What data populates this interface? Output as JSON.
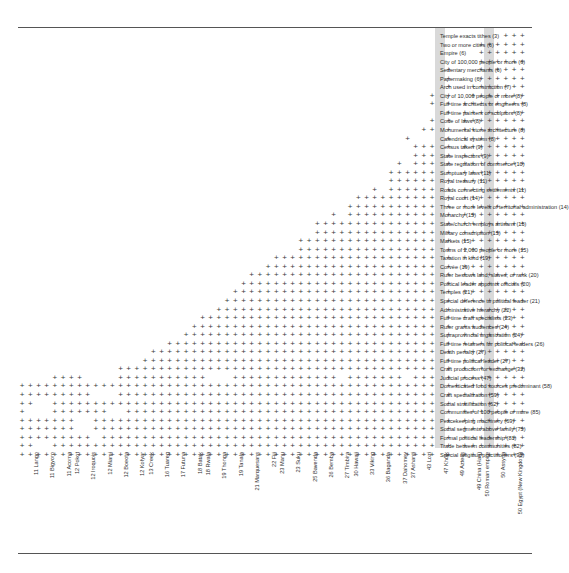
{
  "figure": {
    "type": "guttman-scalogram",
    "mark_glyph": "+",
    "band_color": "#d9d9d9",
    "rule_color": "#555555",
    "mark_color": "#3a3a3a"
  },
  "chart_data": {
    "type": "heatmap",
    "title": "",
    "subtitle": "",
    "xlabel": "",
    "ylabel": "",
    "grid": false,
    "legend": "none",
    "x": [
      "11 Lango",
      "11 Bigyoro",
      "11 Acoma",
      "12 Pokot",
      "12 Iroquois",
      "12 Miami",
      "12 Boeota",
      "12 Kofyar",
      "13 Creek",
      "16 Tuareg",
      "17 Futuna",
      "18 Batak",
      "18 Rwala",
      "19 Thonga",
      "19 Tanala",
      "21 Marquesans",
      "22 Fiji",
      "23 Manu",
      "23 Suku",
      "25 Bavenda",
      "26 Bemba",
      "27 Timbira",
      "30 Hawaii",
      "33 Viking",
      "36 Baganda",
      "37 Dahomey",
      "37 Ashanti",
      "43 Lozi",
      "47 Khoik",
      "49 Aztecs",
      "49 China (Han)",
      "50 Roman empire",
      "50 Assyria",
      "50 Egypt (New Kingdom)"
    ],
    "x_highlighted": [
      "30 Hawaii",
      "47 Khoik"
    ],
    "y": [
      "Temple exacts tithes (3)",
      "Two or more cities  (6)",
      "Empire (6)",
      "City of 100,000 people or more (6)",
      "Sedentary merchants (6)",
      "Papermaking (6)",
      "Arch used in construction (7)",
      "City of 10,000 people or more (8)",
      "Full-time architects or engineers (8)",
      "Full-time painters or sculptors (8)",
      "Code of laws (8)",
      "Monumental stone architecture (8)",
      "Calendrical system (8)",
      "Census taken (9)",
      "State inspectors (9)",
      "State regulation of commerce (10)",
      "Sumptuary laws (11)",
      "Royal treasury (11)",
      "Roads connecting settlements (11)",
      "Royal court  (14)",
      "Three or more levels of territorial administration  (14)",
      "Monarchy (15)",
      "State/church employs artisans (15)",
      "Military conscription (15)",
      "Markets (15)",
      "Towns of 2,000 people or more (15)",
      "Taxation in kind (19)",
      "Corvée (19)",
      "Ruler bestows land, slaves, or rank (20)",
      "Political leader appoints officials (20)",
      "Temples (21)",
      "Special deference to political leader (21)",
      "Administrative hierarchy (22)",
      "Full-time craft specialists  (23)",
      "Ruler grants audiences (24)",
      "Supraprovincial  organization (24)",
      "Full-time retainers for political leaders (26)",
      "Death penalty (27)",
      "Full-time political leader  (27)",
      "Craft production for exchange  (32)",
      "Judicial process (47)",
      "Domesticated food sources predominant  (58)",
      "Craft specialization (59)",
      "Social stratification (62)",
      "Communities of 100 people or more (85)",
      "Peacekeeping machinery (69)",
      "Social segments above family (75)",
      "Formal political leadership (81)",
      "Trade between communities (82)",
      "Special religious practitioners (93)"
    ],
    "counts": [
      3,
      6,
      6,
      6,
      6,
      6,
      7,
      8,
      8,
      8,
      8,
      8,
      8,
      9,
      9,
      10,
      11,
      11,
      11,
      14,
      14,
      15,
      15,
      15,
      15,
      15,
      19,
      19,
      20,
      20,
      21,
      21,
      22,
      23,
      24,
      24,
      26,
      27,
      27,
      32,
      47,
      58,
      59,
      62,
      85,
      69,
      75,
      81,
      82,
      93
    ],
    "n_columns": 62,
    "matrix": [
      "000000000000000000000000000000000000000000000000000000000001110",
      "000000000000000000000000000000000000000000000000000000001111110",
      "000000000000000000000000000000000000000000000000000000001111110",
      "000000000000000000000000000000000000000000000000000000001111110",
      "000000000000000000000000000000000000000000000000000010001111110",
      "000000000000000000000000000000000000000000000000000010001111110",
      "000000000000000000000000000000000000000000000000000010011111110",
      "000000000000000000000000000000000000000000000000001010011111110",
      "000000000000000000000000000000000000000000000000001010111111110",
      "000000000000000000000000000000000000000000000000000010111111110",
      "000000000000000000000000000000000000000000000000001010111111110",
      "000000000000000000000000000000000000000000000000011010111111110",
      "000000000000000000000000000000000000000000000001000010111111110",
      "000000000000000000000000000000000000000000000000111010111111110",
      "000000000000000000000000000000000000000000000000111010111111110",
      "000000000000000000000000000000000000000000000010111010111111110",
      "000000000000000000000000000000000000000000000111111010111111110",
      "000000000000000000000000000000000000000000000111111010111111110",
      "000000000000000000000000000000000000000000010111111010111111110",
      "000000000000000000000000000000000000000001111111111010111111110",
      "000000000000000000000000000000000000000011111111111010111111110",
      "000000000000000000000000000000000000001011111111111010111111110",
      "000000000000000000000000000000000000111111111111111010111111110",
      "000000000000000000000000000000000000111111111111111010111111110",
      "000000000000000000000000000000000011111111111111111010111111110",
      "000000000000000000000000000000000011111111111111111010111111110",
      "000000000000000000000000000000011111111111111111111010111111110",
      "000000000000000000000000000000111111111111111111111010111111110",
      "000000000000000000000000000011111111111111111111111010111111110",
      "000000000000000000000000000111111111111111111111111010111111110",
      "000000000000000000000000001111111111111111111111111010111111110",
      "000000000000000000000000011111111111111111111111111010111111110",
      "000000000000000000000000111111111111111111111111111010111111110",
      "000000000000000000000011111111111111111111111111111010111111110",
      "000000000000000000000111111111111111111111111111111010111111110",
      "000000000000000000001111111111111111111111111111111010111111110",
      "000000000000000000111111111111111111111111111111111010111111110",
      "000000000000000011111111111111111111111111111111111010111111110",
      "000000000000000111111111111111111111111111111111111010111111110",
      "000000000000111111111111111111111111111111111111111010111111110",
      "000011110000111111111110001111111111111011111110111010111111110",
      "111111111111111111111111111111111111111111111111111011111111110",
      "111111111000111111111111111111111111111111111111111010111111110",
      "110011111111111111111111111111111111111111111111111010111111110",
      "100011111110011111111111111111111111111111111111111010111111110",
      "111111100111111111111111111111111111111111111111111010111111110",
      "111111100111111111111111111111111111111111111111111010111111110",
      "111111111011111111111111111111111111111111111111111010111111110",
      "110011111111111111111111111111111111111111111111111010111111110",
      "111111111111111111111111111111111111111111111111111010111111110"
    ],
    "highlight_columns": [
      51,
      57
    ]
  }
}
